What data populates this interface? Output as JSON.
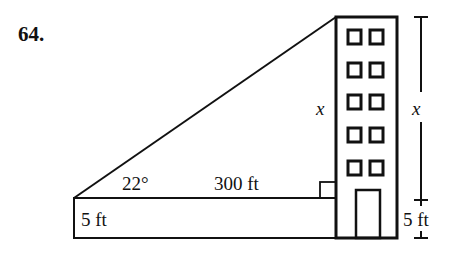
{
  "problem": {
    "number": "64."
  },
  "diagram": {
    "angle_label": "22°",
    "horizontal_distance_label": "300 ft",
    "eye_height_label": "5 ft",
    "building_unknown_label": "x",
    "dimension_unknown_label": "x",
    "dimension_base_label": "5 ft",
    "building": {
      "window_rows": 5,
      "window_columns": 2,
      "has_door": true
    },
    "right_angle_marker": true,
    "stroke_color": "#111111",
    "background_color": "#ffffff"
  }
}
